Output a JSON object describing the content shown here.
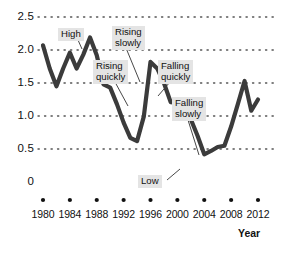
{
  "chart_data": {
    "type": "line",
    "title": "",
    "xlabel": "Year",
    "ylabel": "",
    "xlim": [
      1980,
      2012
    ],
    "ylim": [
      0,
      2.5
    ],
    "grid": true,
    "grid_style": "dotted-horizontal",
    "legend": "none",
    "line_color": "#3b3b3b",
    "x": [
      1980,
      1981,
      1982,
      1983,
      1984,
      1985,
      1986,
      1987,
      1988,
      1989,
      1990,
      1991,
      1992,
      1993,
      1994,
      1995,
      1996,
      1997,
      1998,
      1999,
      2000,
      2001,
      2002,
      2003,
      2004,
      2005,
      2006,
      2007,
      2008,
      2009,
      2010,
      2011,
      2012
    ],
    "values": [
      2.07,
      1.72,
      1.45,
      1.72,
      1.96,
      1.72,
      1.93,
      2.19,
      1.92,
      1.48,
      1.43,
      1.18,
      0.9,
      0.67,
      0.62,
      0.99,
      1.82,
      1.72,
      1.5,
      1.21,
      1.2,
      1.25,
      0.95,
      0.7,
      0.42,
      0.47,
      0.53,
      0.55,
      0.84,
      1.18,
      1.53,
      1.08,
      1.25
    ],
    "xticks": [
      1980,
      1984,
      1988,
      1992,
      1996,
      2000,
      2004,
      2008,
      2012
    ],
    "xtick_labels": [
      "1980",
      "1984",
      "1988",
      "1992",
      "1996",
      "2000",
      "2004",
      "2008",
      "2012"
    ],
    "yticks": [
      0,
      0.5,
      1.0,
      1.5,
      2.0,
      2.5
    ],
    "ytick_labels": [
      "0",
      "0.5",
      "1.0",
      "1.5",
      "2.0",
      "2.5"
    ],
    "annotations": [
      {
        "label": "High",
        "x": 1987,
        "y": 2.19,
        "note": "peak of the series"
      },
      {
        "label": "Rising\nslowly",
        "x": 1995,
        "y": 0.99,
        "note": "gentle upward slope"
      },
      {
        "label": "Rising\nquickly",
        "x": 1995.6,
        "y": 1.4,
        "note": "steep upward slope"
      },
      {
        "label": "Falling\nquickly",
        "x": 1998.4,
        "y": 1.45,
        "note": "steep downward slope"
      },
      {
        "label": "Falling\nslowly",
        "x": 2003.5,
        "y": 0.62,
        "note": "gentle downward slope"
      },
      {
        "label": "Low",
        "x": 2004,
        "y": 0.42,
        "note": "minimum of the series"
      }
    ]
  },
  "axis": {
    "x_title": "Year"
  }
}
